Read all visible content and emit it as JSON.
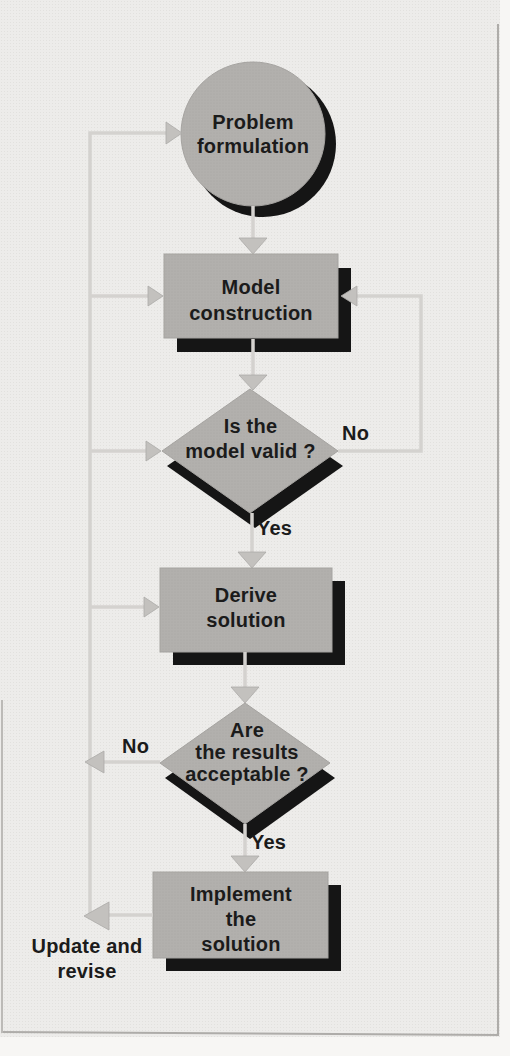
{
  "figure": {
    "type": "flowchart",
    "palette": {
      "background": "#edecea",
      "node_fill": "#b2b0ad",
      "node_shadow": "#151515",
      "connector": "#d4d2cf",
      "arrowhead": "#c3c1be",
      "text": "#1b1b1b",
      "frame_border": "#aeaca9"
    }
  },
  "nodes": {
    "problem": {
      "shape": "circle",
      "label": "Problem\nformulation"
    },
    "model": {
      "shape": "rectangle",
      "label": "Model\nconstruction"
    },
    "valid": {
      "shape": "diamond",
      "label": "Is the\nmodel valid ?"
    },
    "derive": {
      "shape": "rectangle",
      "label": "Derive\nsolution"
    },
    "acceptable": {
      "shape": "diamond",
      "label": "Are\nthe results\nacceptable ?"
    },
    "implement": {
      "shape": "rectangle",
      "label": "Implement\nthe\nsolution"
    }
  },
  "edge_labels": {
    "valid_yes": "Yes",
    "valid_no": "No",
    "acceptable_yes": "Yes",
    "acceptable_no": "No",
    "feedback": "Update and\nrevise"
  },
  "edges": [
    {
      "from": "problem",
      "to": "model"
    },
    {
      "from": "model",
      "to": "valid"
    },
    {
      "from": "valid",
      "to": "model",
      "label": "No"
    },
    {
      "from": "valid",
      "to": "derive",
      "label": "Yes"
    },
    {
      "from": "derive",
      "to": "acceptable"
    },
    {
      "from": "acceptable",
      "to": "feedback-line",
      "label": "No"
    },
    {
      "from": "acceptable",
      "to": "implement",
      "label": "Yes"
    },
    {
      "from": "implement",
      "to": "feedback-line",
      "label": "Update and revise"
    },
    {
      "from": "feedback-line",
      "to": "problem"
    },
    {
      "from": "feedback-line",
      "to": "model"
    },
    {
      "from": "feedback-line",
      "to": "valid"
    },
    {
      "from": "feedback-line",
      "to": "derive"
    }
  ]
}
